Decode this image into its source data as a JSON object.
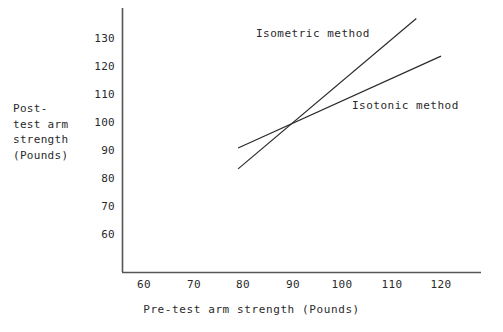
{
  "chart_data": {
    "type": "line",
    "title": "",
    "subtitle": "",
    "xlabel": "Pre-test arm strength (Pounds)",
    "ylabel": "Post-test arm strength (Pounds)",
    "ylabel_lines": [
      "Post-",
      "test arm",
      "strength",
      "(Pounds)"
    ],
    "xlim": [
      55,
      125
    ],
    "ylim": [
      55,
      140
    ],
    "xticks": [
      60,
      70,
      80,
      90,
      100,
      110,
      120
    ],
    "xtick_labels": [
      "60",
      "70",
      "80",
      "90",
      "100",
      "110",
      "120"
    ],
    "yticks": [
      60,
      70,
      80,
      90,
      100,
      110,
      120,
      130
    ],
    "ytick_labels": [
      "60",
      "70",
      "80",
      "90",
      "100",
      "110",
      "120",
      "130"
    ],
    "grid": false,
    "legend_position": "inline-annotations",
    "line_color": "#2a2a2a",
    "axis_color": "#555555",
    "background": "#ffffff",
    "series": [
      {
        "name": "Isometric method",
        "annotation": "Isometric method",
        "x": [
          79,
          115
        ],
        "y": [
          83,
          137
        ],
        "comment": "steeper regression line, crosses the isotonic line at (90, 100)"
      },
      {
        "name": "Isotonic method",
        "annotation": "Isotonic method",
        "x": [
          79,
          120
        ],
        "y": [
          90.5,
          123.5
        ],
        "comment": "shallower regression line, crosses the isometric line at (90, 100)"
      }
    ],
    "intersection": {
      "x": 90,
      "y": 100
    }
  }
}
